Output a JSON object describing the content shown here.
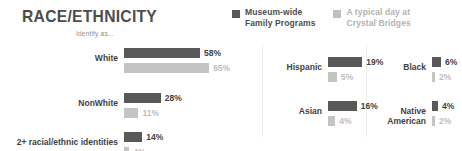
{
  "title": "RACE/ETHNICITY",
  "colors": {
    "dark": "#595959",
    "light": "#c4c4c4",
    "title": "#4d4d4d",
    "label": "#3f3f3f",
    "light_text": "#bdbdbd",
    "divider": "#eeeeee"
  },
  "legend": {
    "items": [
      {
        "label": "Museum-wide\nFamily Programs",
        "swatch": "dark-square-icon",
        "color": "#595959"
      },
      {
        "label": "A typical day at\nCrystal Bridges",
        "swatch": "light-square-icon",
        "color": "#bfbfbf"
      }
    ]
  },
  "panels": [
    {
      "id": "primary",
      "caption": "Identify as...",
      "px_per_percent": 1.31,
      "rows": [
        {
          "label": "White",
          "dark": "58%",
          "light": "65%",
          "dark_value": 58,
          "light_value": 65
        },
        {
          "label": "NonWhite",
          "dark": "28%",
          "light": "11%",
          "dark_value": 28,
          "light_value": 11
        },
        {
          "label": "2+ racial/ethnic identities",
          "dark": "14%",
          "light": "4%",
          "dark_value": 14,
          "light_value": 4
        }
      ]
    },
    {
      "id": "secondary",
      "caption": "",
      "px_per_percent": 1.8,
      "rows": [
        {
          "label": "Hispanic",
          "dark": "19%",
          "light": "5%",
          "dark_value": 19,
          "light_value": 5
        },
        {
          "label": "Asian",
          "dark": "16%",
          "light": "4%",
          "dark_value": 16,
          "light_value": 4
        }
      ]
    },
    {
      "id": "tertiary",
      "caption": "",
      "px_per_percent": 1.5,
      "rows": [
        {
          "label": "Black",
          "dark": "6%",
          "light": "2%",
          "dark_value": 6,
          "light_value": 2
        },
        {
          "label": "Native\nAmerican",
          "dark": "4%",
          "light": "2%",
          "dark_value": 4,
          "light_value": 2
        }
      ]
    }
  ],
  "chart_data": {
    "type": "bar",
    "title": "RACE/ETHNICITY",
    "subtitle": "Identify as...",
    "orientation": "horizontal",
    "xlabel": "",
    "ylabel": "",
    "grid": false,
    "legend_position": "top-right",
    "value_unit": "percent",
    "categories": [
      "White",
      "NonWhite",
      "2+ racial/ethnic identities",
      "Hispanic",
      "Asian",
      "Black",
      "Native American"
    ],
    "series": [
      {
        "name": "Museum-wide Family Programs",
        "color": "#595959",
        "values": [
          58,
          28,
          14,
          19,
          16,
          6,
          4
        ]
      },
      {
        "name": "A typical day at Crystal Bridges",
        "color": "#c4c4c4",
        "values": [
          65,
          11,
          4,
          5,
          4,
          2,
          2
        ]
      }
    ],
    "annotations": [
      "Values are displayed as data labels at the end of each bar.",
      "Chart is split into three visual panels separated by vertical rules."
    ]
  }
}
